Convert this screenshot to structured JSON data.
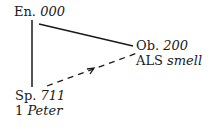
{
  "nodes": {
    "en": {
      "label": "En.",
      "value": "000"
    },
    "ob": {
      "label": "Ob.",
      "value": "200",
      "sub_label": "ALS",
      "sub_value": "smell"
    },
    "sp": {
      "label": "Sp.",
      "value": "711",
      "sub_label": "1",
      "sub_value": "Peter"
    }
  },
  "edges": [
    {
      "from": "en",
      "to": "ob",
      "style": "solid"
    },
    {
      "from": "en",
      "to": "sp",
      "style": "solid"
    },
    {
      "from": "sp",
      "to": "ob",
      "style": "dashed",
      "arrow": "toward-ob"
    }
  ],
  "colors": {
    "ink": "#1a1a1a",
    "background": "#ffffff"
  }
}
